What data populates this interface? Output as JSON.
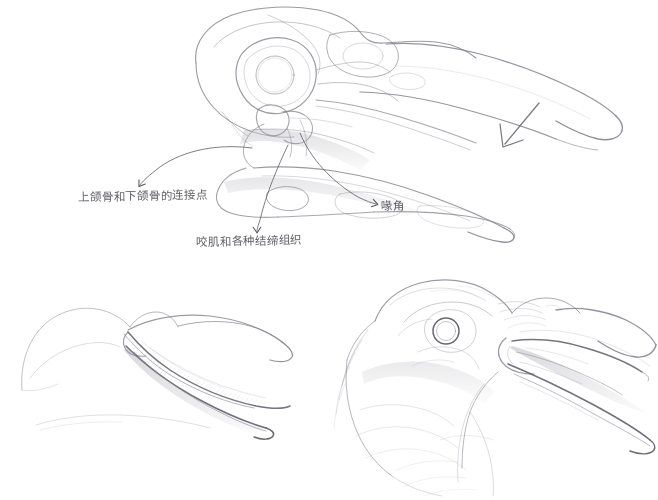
{
  "page": {
    "medium": "pencil sketch on white paper",
    "background_color": "#ffffff",
    "pencil_color": "#6e6e78",
    "pencil_dark_color": "#4a4a52"
  },
  "annotations": {
    "joint": {
      "text": "上颌骨和下颌骨的连接点",
      "meaning": "connection point of upper and lower jaw bones"
    },
    "muscle": {
      "text": "咬肌和各种结缔组织",
      "meaning": "masseter muscle and various connective tissues"
    },
    "gape": {
      "text": "喙角",
      "meaning": "beak corner / gape"
    }
  },
  "figures": [
    {
      "name": "skull-profile",
      "caption": ""
    },
    {
      "name": "open-beak-study",
      "caption": ""
    },
    {
      "name": "crow-head-open-beak",
      "caption": ""
    }
  ]
}
